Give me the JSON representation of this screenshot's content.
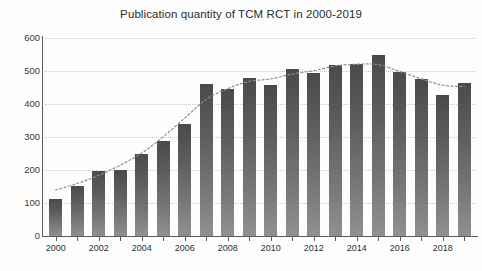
{
  "chart_data": {
    "type": "bar",
    "title": "Publication quantity of TCM RCT in 2000-2019",
    "xlabel": "",
    "ylabel": "",
    "ylim": [
      0,
      600
    ],
    "yticks": [
      0,
      100,
      200,
      300,
      400,
      500,
      600
    ],
    "ytick_labels": [
      "0",
      "100",
      "200",
      "300",
      "400",
      "500",
      "600"
    ],
    "grid": true,
    "legend": "none",
    "categories": [
      "2000",
      "2001",
      "2002",
      "2003",
      "2004",
      "2005",
      "2006",
      "2007",
      "2008",
      "2009",
      "2010",
      "2011",
      "2012",
      "2013",
      "2014",
      "2015",
      "2016",
      "2017",
      "2018",
      "2019"
    ],
    "xtick_labels_shown": [
      "2000",
      "2002",
      "2004",
      "2006",
      "2008",
      "2010",
      "2012",
      "2014",
      "2016",
      "2018"
    ],
    "values": [
      112,
      152,
      196,
      200,
      250,
      288,
      340,
      462,
      446,
      480,
      458,
      505,
      495,
      518,
      520,
      548,
      498,
      475,
      427,
      463
    ],
    "annotations": [
      {
        "name": "trend-curve",
        "style": "dotted",
        "description": "smooth rising then flattening trend line overlaying the bars"
      }
    ],
    "colors": {
      "bar_top": "#4a4a4a",
      "bar_bottom": "#909090",
      "gridline": "#c9c9c9",
      "axis": "#5a5a5a",
      "title_text": "#2b2b2b",
      "tick_text": "#2f2f2f"
    }
  }
}
